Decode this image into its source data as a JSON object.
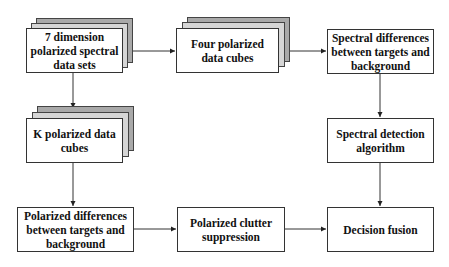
{
  "diagram": {
    "type": "flowchart",
    "nodes": [
      {
        "id": "A",
        "label": "7 dimension polarized spectral data sets",
        "stacked": true
      },
      {
        "id": "B",
        "label": "Four polarized data cubes",
        "stacked": true
      },
      {
        "id": "C",
        "label": "Spectral differences between targets and background",
        "stacked": false
      },
      {
        "id": "D",
        "label": "K polarized data cubes",
        "stacked": true
      },
      {
        "id": "E",
        "label": "Spectral detection algorithm",
        "stacked": false
      },
      {
        "id": "F",
        "label": "Polarized differences between targets and background",
        "stacked": false
      },
      {
        "id": "G",
        "label": "Polarized clutter suppression",
        "stacked": false
      },
      {
        "id": "H",
        "label": "Decision fusion",
        "stacked": false
      }
    ],
    "edges": [
      {
        "from": "A",
        "to": "B"
      },
      {
        "from": "B",
        "to": "C"
      },
      {
        "from": "A",
        "to": "D"
      },
      {
        "from": "C",
        "to": "E"
      },
      {
        "from": "D",
        "to": "F"
      },
      {
        "from": "F",
        "to": "G"
      },
      {
        "from": "E",
        "to": "H"
      },
      {
        "from": "G",
        "to": "H"
      }
    ]
  },
  "colors": {
    "line": "#333333",
    "layer_back": "#a9a9a9",
    "layer_mid": "#d6d6d6",
    "box_fill": "#ffffff"
  }
}
